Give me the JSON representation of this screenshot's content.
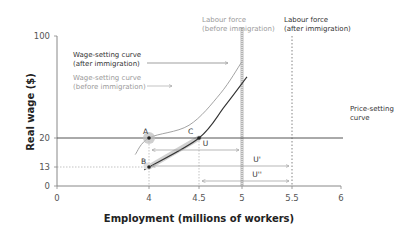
{
  "chart_data": {
    "type": "line",
    "title": "",
    "xlabel": "Employment (millions of workers)",
    "ylabel": "Real wage ($)",
    "xlim": [
      0,
      6
    ],
    "ylim": [
      0,
      100
    ],
    "x_ticks": [
      {
        "value": 0,
        "label": "0"
      },
      {
        "value": 4,
        "label": "4"
      },
      {
        "value": 4.5,
        "label": "4.5"
      },
      {
        "value": 5,
        "label": "5"
      },
      {
        "value": 5.5,
        "label": "5.5"
      },
      {
        "value": 6,
        "label": "6"
      }
    ],
    "y_ticks": [
      {
        "value": 0,
        "label": "0"
      },
      {
        "value": 13,
        "label": "13"
      },
      {
        "value": 20,
        "label": "20"
      },
      {
        "value": 100,
        "label": "100"
      }
    ],
    "grid": false,
    "series": [
      {
        "name": "Wage-setting curve (before immigration)",
        "style": "light",
        "points": [
          [
            3.4,
            16
          ],
          [
            4.0,
            20
          ],
          [
            4.4,
            30
          ],
          [
            4.75,
            55
          ],
          [
            5.0,
            80
          ]
        ]
      },
      {
        "name": "Wage-setting curve (after immigration)",
        "style": "dark",
        "points": [
          [
            3.9,
            12
          ],
          [
            4.0,
            13
          ],
          [
            4.5,
            20
          ],
          [
            4.8,
            45
          ],
          [
            5.05,
            68
          ]
        ]
      },
      {
        "name": "Price-setting curve",
        "style": "horizontal",
        "value": 20
      }
    ],
    "vertical_lines": [
      {
        "name": "Labour force (before immigration)",
        "x": 5,
        "label_line1": "Labour force",
        "label_line2": "(before immigration)",
        "style": "heavy-dotted"
      },
      {
        "name": "Labour force (after immigration)",
        "x": 5.5,
        "label_line1": "Labour force",
        "label_line2": "(after immigration)",
        "style": "dotted"
      }
    ],
    "points": [
      {
        "label": "A",
        "x": 4,
        "y": 20
      },
      {
        "label": "B",
        "x": 4,
        "y": 13
      },
      {
        "label": "C",
        "x": 4.5,
        "y": 20
      }
    ],
    "unemployment_arrows": [
      {
        "label": "U",
        "from": 4,
        "to": 5
      },
      {
        "label": "U'",
        "from": 4,
        "to": 5.5
      },
      {
        "label": "U''",
        "from": 4.5,
        "to": 5.5
      }
    ],
    "annotations": {
      "ws_after_line1": "Wage-setting curve",
      "ws_after_line2": "(after immigration)",
      "ws_before_line1": "Wage-setting curve",
      "ws_before_line2": "(before immigration)",
      "ps_line1": "Price-setting",
      "ps_line2": "curve"
    },
    "colors": {
      "axis": "#888888",
      "dark_curve": "#333333",
      "light_curve": "#999999",
      "price_line": "#555555",
      "guide": "#aaaaaa",
      "highlight": "#bbbbbb"
    }
  }
}
